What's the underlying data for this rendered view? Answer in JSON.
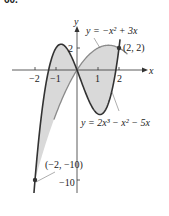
{
  "exercise_number": "60.",
  "chart_data": {
    "type": "line",
    "title": "",
    "xlabel": "x",
    "ylabel": "y",
    "xlim": [
      -2.1,
      2.4
    ],
    "ylim": [
      -11,
      3.2
    ],
    "grid": false,
    "x_ticks": [
      -2,
      -1,
      1,
      2
    ],
    "x_tick_labels": [
      "−2",
      "−1",
      "1",
      "2"
    ],
    "y_ticks": [
      2,
      -10
    ],
    "y_tick_labels": [
      "2",
      "−10"
    ],
    "series": [
      {
        "name": "y = −x² + 3x",
        "equation": "y = -x^2 + 3x",
        "color": "#8a8a8a",
        "x_range": [
          -1.1,
          2.4
        ],
        "points": [
          [
            -1,
            -4
          ],
          [
            0,
            0
          ],
          [
            1,
            2
          ],
          [
            1.5,
            2.25
          ],
          [
            2,
            2
          ]
        ]
      },
      {
        "name": "y = 2x³ − x² − 5x",
        "equation": "y = 2x^3 - x^2 - 5x",
        "color": "#333333",
        "x_range": [
          -2.05,
          2.05
        ],
        "points": [
          [
            -2,
            -10
          ],
          [
            -1,
            2
          ],
          [
            0,
            0
          ],
          [
            1,
            -4
          ],
          [
            2,
            2
          ]
        ]
      }
    ],
    "shaded_region": {
      "between": [
        "y = −x² + 3x",
        "y = 2x³ − x² − 5x"
      ],
      "x_from": -2,
      "x_to": 2,
      "color": "#d9d9d9"
    },
    "annotations": [
      {
        "text": "(2, 2)",
        "x": 2,
        "y": 2
      },
      {
        "text": "(−2, −10)",
        "x": -2,
        "y": -10
      }
    ],
    "legend_labels": {
      "parabola": "y = −x² + 3x",
      "cubic": "y = 2x³ − x² − 5x"
    }
  }
}
